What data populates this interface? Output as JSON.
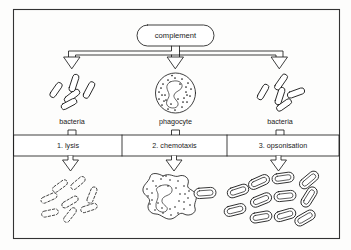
{
  "figure": {
    "source_box_label": "complement",
    "background_color": "#fdfdfc",
    "ink_color": "#1d1d1d",
    "frame_color": "#333333"
  },
  "top_row": {
    "targets": [
      {
        "id": "left",
        "label": "bacteria",
        "icon": "bacteria-cluster-icon"
      },
      {
        "id": "center",
        "label": "phagocyte",
        "icon": "phagocyte-cell-icon"
      },
      {
        "id": "right",
        "label": "bacteria",
        "icon": "bacteria-cluster-icon"
      }
    ]
  },
  "process_row": {
    "cells": [
      {
        "number": "1.",
        "name": "lysis",
        "label": "1. lysis"
      },
      {
        "number": "2.",
        "name": "chemotaxis",
        "label": "2. chemotaxis"
      },
      {
        "number": "3.",
        "name": "opsonisation",
        "label": "3. opsonisation"
      }
    ]
  },
  "bottom_row": {
    "outcomes": [
      {
        "id": "lysed-bacteria",
        "icon": "lysed-bacteria-icon",
        "description_visual": "broken dashed outline rods"
      },
      {
        "id": "migrating-phagocyte",
        "icon": "amoeboid-phagocyte-icon",
        "description_visual": "amoeboid phagocyte engulfing a bacterium"
      },
      {
        "id": "opsonised-bacteria",
        "icon": "coated-bacteria-icon",
        "description_visual": "rods with double coated outlines"
      }
    ]
  },
  "arrows": {
    "top_branch": "hollow-block-arrow",
    "down_arrows": "hollow-down-arrow",
    "count_top": 3,
    "count_bottom": 3
  }
}
